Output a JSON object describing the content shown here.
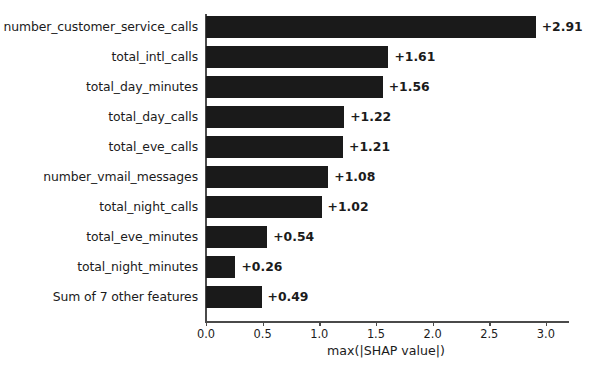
{
  "chart_data": {
    "type": "bar",
    "orientation": "horizontal",
    "title": "",
    "xlabel": "max(|SHAP value|)",
    "ylabel": "",
    "xlim": [
      0.0,
      3.2
    ],
    "xticks": [
      0.0,
      0.5,
      1.0,
      1.5,
      2.0,
      2.5,
      3.0
    ],
    "xtick_labels": [
      "0.0",
      "0.5",
      "1.0",
      "1.5",
      "2.0",
      "2.5",
      "3.0"
    ],
    "grid": false,
    "legend": null,
    "bar_color": "#1a1a1a",
    "background_color": "#ffffff",
    "categories": [
      "number_customer_service_calls",
      "total_intl_calls",
      "total_day_minutes",
      "total_day_calls",
      "total_eve_calls",
      "number_vmail_messages",
      "total_night_calls",
      "total_eve_minutes",
      "total_night_minutes",
      "Sum of 7 other features"
    ],
    "values": [
      2.91,
      1.61,
      1.56,
      1.22,
      1.21,
      1.08,
      1.02,
      0.54,
      0.26,
      0.49
    ],
    "value_labels": [
      "+2.91",
      "+1.61",
      "+1.56",
      "+1.22",
      "+1.21",
      "+1.08",
      "+1.02",
      "+0.54",
      "+0.26",
      "+0.49"
    ]
  }
}
